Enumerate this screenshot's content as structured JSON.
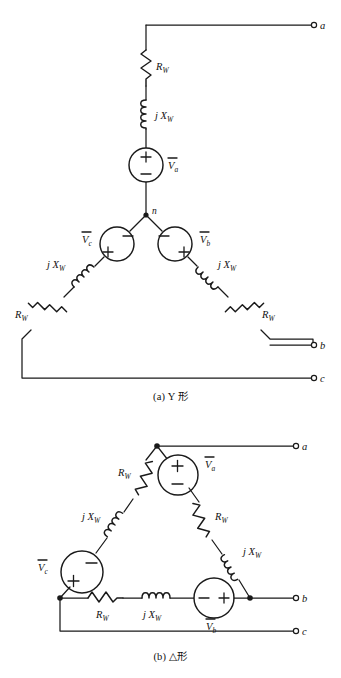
{
  "figure": {
    "type": "circuit-diagram",
    "stroke_color": "#1a1a1a",
    "background_color": "#ffffff"
  },
  "labels": {
    "resistor": {
      "symbol": "R",
      "sub": "W"
    },
    "inductor": {
      "symbol": "j X",
      "sub": "W"
    },
    "source_a": {
      "symbol": "V",
      "sub": "a",
      "overbar": true
    },
    "source_b": {
      "symbol": "V",
      "sub": "b",
      "overbar": true
    },
    "source_c": {
      "symbol": "V",
      "sub": "c",
      "overbar": true
    },
    "plus": "+",
    "minus": "−",
    "neutral": "n",
    "terminal_a": "a",
    "terminal_b": "b",
    "terminal_c": "c"
  },
  "diagram_a": {
    "caption": "(a) Y 形",
    "topology": "wye",
    "neutral_node": "n",
    "terminals": [
      "a",
      "b",
      "c"
    ],
    "branches": [
      {
        "phase": "a",
        "components": [
          "R_W",
          "jX_W",
          "V_a"
        ],
        "source_polarity": {
          "top": "+",
          "bottom": "−"
        }
      },
      {
        "phase": "b",
        "components": [
          "V_b",
          "jX_W",
          "R_W"
        ],
        "source_polarity": {
          "top": "−",
          "bottom": "+"
        }
      },
      {
        "phase": "c",
        "components": [
          "V_c",
          "jX_W",
          "R_W"
        ],
        "source_polarity": {
          "top": "−",
          "bottom": "+"
        }
      }
    ]
  },
  "diagram_b": {
    "caption": "(b) △形",
    "topology": "delta",
    "terminals": [
      "a",
      "b",
      "c"
    ],
    "branches": [
      {
        "name": "apex-to-left",
        "components": [
          "R_W",
          "jX_W",
          "V_c"
        ],
        "source_polarity": {
          "upper": "−",
          "lower": "+"
        }
      },
      {
        "name": "apex-to-right",
        "components": [
          "V_a",
          "R_W",
          "jX_W"
        ],
        "source_polarity": {
          "top": "+",
          "bottom": "−"
        }
      },
      {
        "name": "bottom",
        "components": [
          "R_W",
          "jX_W",
          "V_b"
        ],
        "source_polarity": {
          "left": "−",
          "right": "+"
        }
      }
    ]
  }
}
